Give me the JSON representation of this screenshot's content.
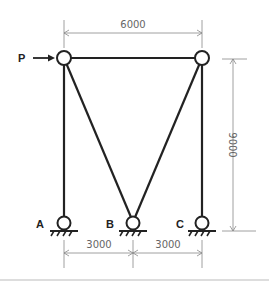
{
  "diagram": {
    "load": {
      "label": "P"
    },
    "supports": [
      {
        "label": "A"
      },
      {
        "label": "B"
      },
      {
        "label": "C"
      }
    ],
    "dimensions": {
      "top_span": "6000",
      "height": "9000",
      "bottom_left": "3000",
      "bottom_right": "3000"
    }
  }
}
